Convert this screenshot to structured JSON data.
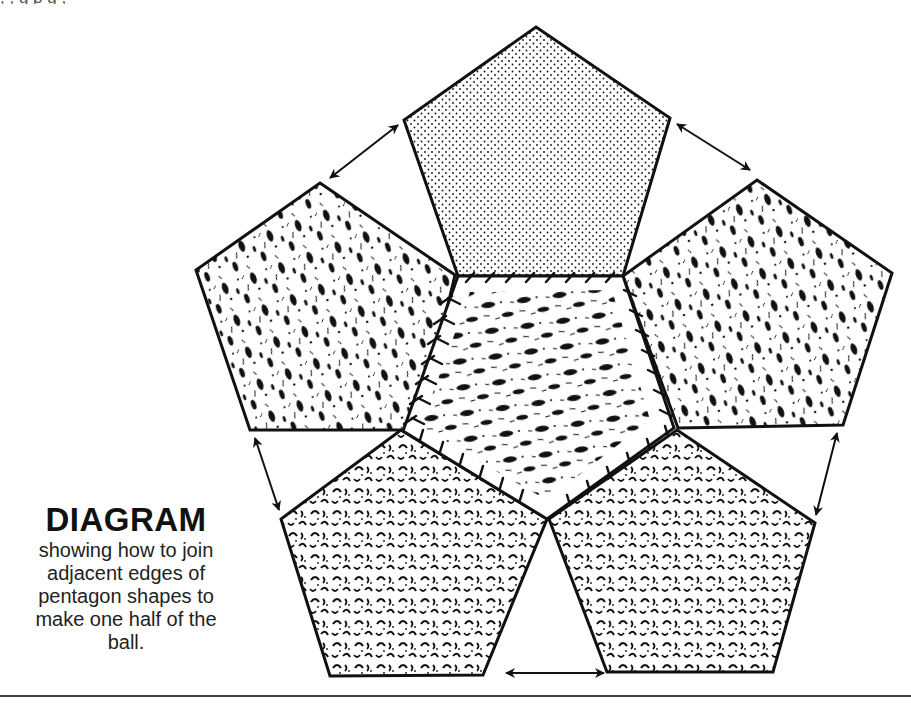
{
  "top_strip_text": ", , g      p   g          ,",
  "caption": {
    "title": "DIAGRAM",
    "lines": [
      "showing how to join",
      "adjacent edges of",
      "pentagon shapes to",
      "make one half of the",
      "ball."
    ]
  },
  "diagram": {
    "pentagons": [
      {
        "id": "top",
        "texture": "fine-stipple-dots",
        "points": [
          [
            536,
            27
          ],
          [
            670,
            118
          ],
          [
            623,
            276
          ],
          [
            458,
            276
          ],
          [
            404,
            120
          ]
        ]
      },
      {
        "id": "left",
        "texture": "dark-blotches",
        "points": [
          [
            320,
            183
          ],
          [
            455,
            275
          ],
          [
            418,
            430
          ],
          [
            250,
            430
          ],
          [
            196,
            270
          ]
        ]
      },
      {
        "id": "right",
        "texture": "dark-blotches",
        "points": [
          [
            757,
            180
          ],
          [
            892,
            273
          ],
          [
            843,
            425
          ],
          [
            678,
            428
          ],
          [
            623,
            276
          ]
        ]
      },
      {
        "id": "center",
        "texture": "horizontal-blotches",
        "points": [
          [
            458,
            276
          ],
          [
            623,
            276
          ],
          [
            674,
            428
          ],
          [
            547,
            519
          ],
          [
            403,
            431
          ]
        ]
      },
      {
        "id": "bottom-left",
        "texture": "curly-marks",
        "points": [
          [
            401,
            430
          ],
          [
            547,
            519
          ],
          [
            483,
            675
          ],
          [
            330,
            676
          ],
          [
            281,
            519
          ]
        ]
      },
      {
        "id": "bottom-right",
        "texture": "curly-marks",
        "points": [
          [
            677,
            430
          ],
          [
            815,
            523
          ],
          [
            773,
            672
          ],
          [
            607,
            672
          ],
          [
            549,
            519
          ]
        ]
      }
    ],
    "arrows": [
      {
        "id": "top-left-join",
        "from": [
          330,
          178
        ],
        "to": [
          398,
          125
        ]
      },
      {
        "id": "top-right-join",
        "from": [
          677,
          124
        ],
        "to": [
          750,
          170
        ]
      },
      {
        "id": "left-bottom-join",
        "from": [
          255,
          438
        ],
        "to": [
          279,
          510
        ]
      },
      {
        "id": "right-bottom-join",
        "from": [
          837,
          433
        ],
        "to": [
          816,
          515
        ]
      },
      {
        "id": "bottom-join",
        "from": [
          506,
          673
        ],
        "to": [
          604,
          673
        ]
      }
    ],
    "colors": {
      "ink": "#111111",
      "paper": "#ffffff"
    }
  }
}
